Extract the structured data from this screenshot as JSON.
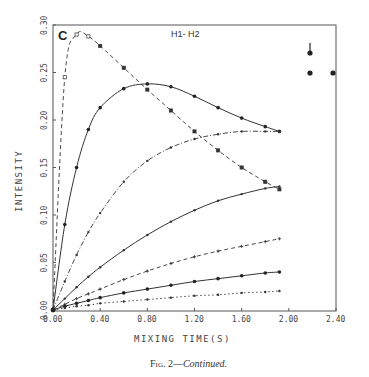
{
  "figure": {
    "panel_letter": "C",
    "plot_title": "H1- H2",
    "caption_prefix": "Fig. 2—",
    "caption_italic": "Continued."
  },
  "chart_data": {
    "type": "line",
    "title": "H1- H2",
    "panel": "C",
    "xlabel": "MIXING TIME(S)",
    "ylabel": "INTENSITY",
    "xlim": [
      0.0,
      2.4
    ],
    "ylim": [
      0.0,
      0.3
    ],
    "x_ticks": [
      "0.00",
      "0.40",
      "0.80",
      "1.20",
      "1.60",
      "2.00",
      "2.40"
    ],
    "y_ticks": [
      "0.00",
      "0.05",
      "0.10",
      "0.15",
      "0.20",
      "0.25",
      "0.30"
    ],
    "grid": false,
    "legend": "none (inset schematic of three spin positions, top-right)",
    "x": [
      0.0,
      0.1,
      0.2,
      0.3,
      0.4,
      0.6,
      0.8,
      1.0,
      1.2,
      1.4,
      1.6,
      1.8,
      1.92
    ],
    "series": [
      {
        "name": "curve-1 (dashed, open squares)",
        "style": "dashed",
        "marker": "square-open",
        "values": [
          0.0,
          0.245,
          0.29,
          0.288,
          0.278,
          0.255,
          0.232,
          0.21,
          0.188,
          0.168,
          0.15,
          0.135,
          0.127
        ]
      },
      {
        "name": "curve-2 (solid, filled circles)",
        "style": "solid",
        "marker": "circle-filled",
        "values": [
          0.0,
          0.09,
          0.15,
          0.19,
          0.213,
          0.233,
          0.238,
          0.235,
          0.225,
          0.213,
          0.202,
          0.193,
          0.188
        ]
      },
      {
        "name": "curve-3 (dash-dot, dots)",
        "style": "dashdot",
        "marker": "dot",
        "values": [
          0.0,
          0.03,
          0.058,
          0.082,
          0.102,
          0.135,
          0.157,
          0.171,
          0.18,
          0.185,
          0.188,
          0.188,
          0.188
        ]
      },
      {
        "name": "curve-4 (solid, dots)",
        "style": "solid",
        "marker": "dot",
        "values": [
          0.0,
          0.012,
          0.024,
          0.035,
          0.045,
          0.063,
          0.079,
          0.093,
          0.105,
          0.115,
          0.122,
          0.128,
          0.13
        ]
      },
      {
        "name": "curve-5 (dashed, crosses)",
        "style": "dashed",
        "marker": "cross",
        "values": [
          0.0,
          0.006,
          0.012,
          0.017,
          0.022,
          0.032,
          0.041,
          0.049,
          0.056,
          0.062,
          0.067,
          0.072,
          0.075
        ]
      },
      {
        "name": "curve-6 (solid, filled circles)",
        "style": "solid",
        "marker": "circle-filled",
        "values": [
          0.0,
          0.004,
          0.007,
          0.01,
          0.013,
          0.018,
          0.022,
          0.026,
          0.03,
          0.033,
          0.036,
          0.039,
          0.04
        ]
      },
      {
        "name": "curve-7 (dotted, dots)",
        "style": "dotted",
        "marker": "dot",
        "values": [
          0.0,
          0.002,
          0.004,
          0.005,
          0.007,
          0.009,
          0.011,
          0.013,
          0.015,
          0.016,
          0.018,
          0.019,
          0.02
        ]
      }
    ]
  },
  "plot_box": {
    "left": 53,
    "right": 336,
    "top": 25,
    "bottom": 311
  },
  "inset": {
    "points": [
      {
        "x": 310,
        "y": 53,
        "arrow": true
      },
      {
        "x": 310,
        "y": 73,
        "arrow": false
      },
      {
        "x": 333,
        "y": 73,
        "arrow": false
      }
    ]
  }
}
